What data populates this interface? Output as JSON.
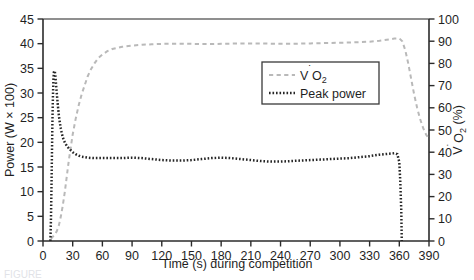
{
  "figure": {
    "caption_clipped": "FIGURE"
  },
  "chart_data": {
    "type": "line",
    "title": "",
    "xlabel": "Time (s) during competition",
    "xlim": [
      0,
      390
    ],
    "xticks": [
      0,
      30,
      60,
      90,
      120,
      150,
      180,
      210,
      240,
      270,
      300,
      330,
      360,
      390
    ],
    "grid": false,
    "legend_position": "upper-right-inside",
    "axes": [
      {
        "id": "left",
        "label_parts": [
          "Power (W ",
          "×",
          " 100)"
        ],
        "label": "Power (W × 100)",
        "ylim": [
          0,
          45
        ],
        "yticks": [
          0,
          5,
          10,
          15,
          20,
          25,
          30,
          35,
          40,
          45
        ],
        "side": "left"
      },
      {
        "id": "right",
        "label": "VO2 (%)",
        "label_prefix": "V",
        "label_sub": "2",
        "label_suffix": " (%)",
        "label_mid": "O",
        "ylim": [
          0,
          100
        ],
        "yticks": [
          0,
          10,
          20,
          30,
          40,
          50,
          60,
          70,
          80,
          90,
          100
        ],
        "side": "right"
      }
    ],
    "series": [
      {
        "name": "VO2",
        "legend_label": "VO2",
        "legend_prefix": "V",
        "legend_mid": "O",
        "legend_sub": "2",
        "axis": "right",
        "style": "dashed",
        "color": "#b9b9b9",
        "x": [
          8,
          10,
          12,
          14,
          16,
          18,
          20,
          22,
          24,
          26,
          28,
          30,
          33,
          36,
          39,
          42,
          45,
          48,
          52,
          56,
          60,
          65,
          70,
          75,
          80,
          90,
          100,
          110,
          120,
          130,
          140,
          150,
          160,
          170,
          180,
          190,
          200,
          210,
          220,
          230,
          240,
          250,
          260,
          270,
          280,
          290,
          300,
          310,
          320,
          330,
          340,
          350,
          355,
          360,
          363,
          366,
          369,
          372,
          375,
          378,
          381,
          384,
          387,
          390
        ],
        "y": [
          1,
          2,
          3,
          4.5,
          7,
          11,
          16,
          22,
          29,
          36,
          42,
          48,
          55,
          61,
          66,
          70,
          74,
          77,
          80,
          82.5,
          84,
          85.5,
          86.5,
          87,
          87.5,
          88,
          88.4,
          88.6,
          88.8,
          88.9,
          88.9,
          88.8,
          88.7,
          88.7,
          88.8,
          88.9,
          89,
          89,
          89,
          88.9,
          88.8,
          88.8,
          88.9,
          89,
          89.1,
          89.2,
          89.3,
          89.4,
          89.6,
          89.8,
          90.2,
          90.8,
          91.2,
          91.3,
          90,
          86,
          80,
          73,
          66,
          60,
          55,
          51,
          48,
          46
        ]
      },
      {
        "name": "Peak power",
        "legend_label": "Peak power",
        "axis": "left",
        "style": "dotted",
        "color": "#262626",
        "x": [
          7.5,
          8,
          8.5,
          9,
          9.5,
          10,
          10.5,
          11,
          11.5,
          12,
          12.5,
          13,
          13.5,
          14,
          15,
          16,
          17,
          18,
          19,
          20,
          22,
          24,
          26,
          28,
          30,
          33,
          36,
          39,
          42,
          45,
          50,
          55,
          60,
          70,
          80,
          90,
          100,
          110,
          120,
          130,
          140,
          150,
          160,
          170,
          180,
          190,
          200,
          210,
          220,
          230,
          240,
          250,
          260,
          270,
          280,
          290,
          300,
          310,
          320,
          330,
          340,
          350,
          355,
          358,
          360,
          361,
          362,
          362.5
        ],
        "y": [
          0,
          4,
          10,
          17,
          24,
          29,
          32.5,
          34.2,
          34.5,
          34.3,
          33.5,
          32.2,
          31,
          29.8,
          27.5,
          25.5,
          24,
          22.8,
          21.8,
          21,
          20,
          19.3,
          18.8,
          18.4,
          18,
          17.6,
          17.3,
          17.1,
          17,
          16.9,
          16.8,
          16.8,
          16.8,
          16.8,
          16.8,
          16.9,
          16.8,
          16.6,
          16.4,
          16.3,
          16.3,
          16.4,
          16.6,
          16.8,
          16.9,
          16.8,
          16.6,
          16.4,
          16.2,
          16.1,
          16.1,
          16.2,
          16.3,
          16.4,
          16.5,
          16.6,
          16.7,
          16.8,
          17,
          17.2,
          17.5,
          17.7,
          17.8,
          17.6,
          16,
          12,
          6,
          0
        ]
      }
    ]
  }
}
